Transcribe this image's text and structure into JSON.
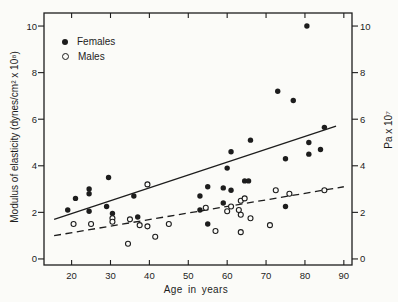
{
  "figure": {
    "background": "#fbfbf8",
    "ink": "#1d1d1d"
  },
  "legend": {
    "items": [
      {
        "label": "Females",
        "marker": "filled-circle"
      },
      {
        "label": "Males",
        "marker": "open-circle"
      }
    ]
  },
  "chart_data": {
    "type": "scatter",
    "title": "",
    "xlabel": "Age in years",
    "ylabel_left": "Modulus of elasticity (dynes/cm² x 10⁸)",
    "ylabel_right": "Pa x 10⁷",
    "x_ticks": [
      20,
      30,
      40,
      50,
      60,
      70,
      80,
      90
    ],
    "y_ticks_left": [
      0,
      2,
      4,
      6,
      8,
      10
    ],
    "y_ticks_right": [
      0,
      2,
      4,
      6,
      8,
      10
    ],
    "xlim": [
      12.9,
      92.1
    ],
    "ylim": [
      -0.26,
      10.56
    ],
    "grid": false,
    "legend_position": "upper-left-inside",
    "series": [
      {
        "name": "Females",
        "marker": "filled-circle",
        "points": [
          [
            19,
            2.1
          ],
          [
            21,
            2.6
          ],
          [
            24.5,
            3.0
          ],
          [
            24.5,
            2.8
          ],
          [
            24.5,
            2.05
          ],
          [
            29,
            2.25
          ],
          [
            29.5,
            3.5
          ],
          [
            30.5,
            1.95
          ],
          [
            36,
            2.7
          ],
          [
            37,
            1.8
          ],
          [
            53,
            2.7
          ],
          [
            53,
            2.1
          ],
          [
            55,
            3.1
          ],
          [
            55,
            1.5
          ],
          [
            59,
            2.4
          ],
          [
            59,
            3.05
          ],
          [
            60,
            3.9
          ],
          [
            61,
            2.95
          ],
          [
            61,
            4.6
          ],
          [
            64.5,
            3.35
          ],
          [
            65.5,
            3.35
          ],
          [
            66,
            5.1
          ],
          [
            73,
            7.2
          ],
          [
            75,
            4.3
          ],
          [
            75,
            2.25
          ],
          [
            77,
            6.8
          ],
          [
            80.5,
            10
          ],
          [
            81,
            5.0
          ],
          [
            81,
            4.5
          ],
          [
            84,
            4.7
          ],
          [
            85,
            5.65
          ]
        ]
      },
      {
        "name": "Males",
        "marker": "open-circle",
        "points": [
          [
            20.5,
            1.5
          ],
          [
            25,
            1.5
          ],
          [
            30.5,
            1.75
          ],
          [
            30.5,
            1.6
          ],
          [
            34.5,
            0.65
          ],
          [
            35,
            1.7
          ],
          [
            37.5,
            1.45
          ],
          [
            39.5,
            1.4
          ],
          [
            39.5,
            3.2
          ],
          [
            41.5,
            0.95
          ],
          [
            45,
            1.5
          ],
          [
            54.5,
            2.2
          ],
          [
            57,
            1.2
          ],
          [
            60,
            2.05
          ],
          [
            61,
            2.25
          ],
          [
            63,
            2.1
          ],
          [
            63.5,
            2.5
          ],
          [
            63.5,
            1.9
          ],
          [
            63.5,
            1.15
          ],
          [
            64.5,
            2.6
          ],
          [
            66,
            1.75
          ],
          [
            71,
            1.45
          ],
          [
            72.5,
            2.95
          ],
          [
            76,
            2.8
          ],
          [
            85,
            2.95
          ]
        ]
      }
    ],
    "trend_lines": [
      {
        "series": "Females",
        "style": "solid",
        "from": [
          15.5,
          1.7
        ],
        "to": [
          88,
          5.7
        ]
      },
      {
        "series": "Males",
        "style": "dashed",
        "from": [
          15.5,
          1.0
        ],
        "to": [
          90,
          3.1
        ]
      }
    ]
  }
}
